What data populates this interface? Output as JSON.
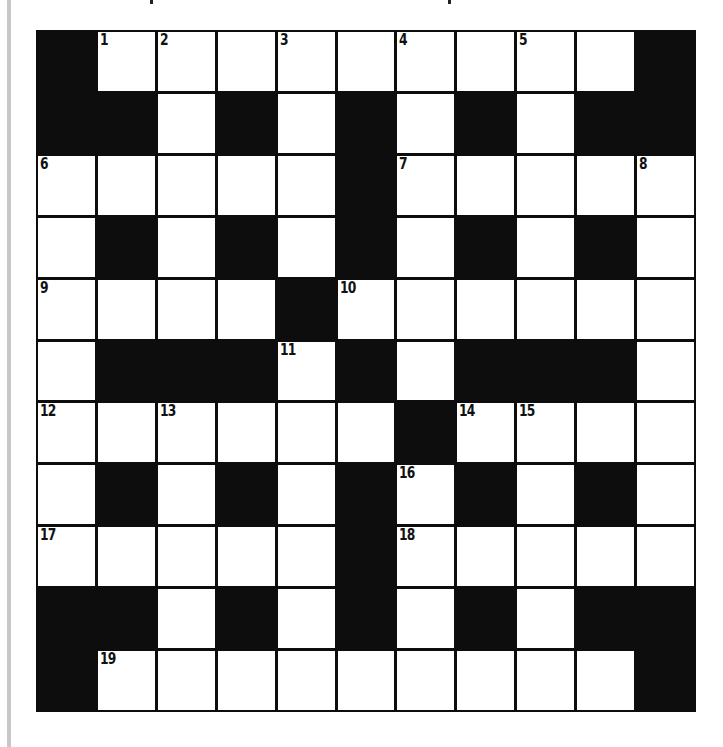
{
  "puzzle": {
    "rows": 11,
    "cols": 11,
    "colors": {
      "block": "#0d0d0d",
      "cell": "#ffffff",
      "grid_line": "#0d0d0d",
      "left_rule": "#c8c8c8"
    },
    "layout": [
      "#.........#",
      "##.#.#.#.##",
      ".....#.....",
      ".#.#.#.#.#.",
      "....#......",
      ".###.#.###.",
      "......#....",
      ".#.#.#.#.#.",
      ".....#.....",
      "##.#.#.#.##",
      "#.........#"
    ],
    "numbers": [
      {
        "row": 0,
        "col": 1,
        "label": "1"
      },
      {
        "row": 0,
        "col": 2,
        "label": "2"
      },
      {
        "row": 0,
        "col": 4,
        "label": "3"
      },
      {
        "row": 0,
        "col": 6,
        "label": "4"
      },
      {
        "row": 0,
        "col": 8,
        "label": "5"
      },
      {
        "row": 2,
        "col": 0,
        "label": "6"
      },
      {
        "row": 2,
        "col": 6,
        "label": "7"
      },
      {
        "row": 2,
        "col": 10,
        "label": "8"
      },
      {
        "row": 4,
        "col": 0,
        "label": "9"
      },
      {
        "row": 4,
        "col": 5,
        "label": "10"
      },
      {
        "row": 5,
        "col": 4,
        "label": "11"
      },
      {
        "row": 6,
        "col": 0,
        "label": "12"
      },
      {
        "row": 6,
        "col": 2,
        "label": "13"
      },
      {
        "row": 6,
        "col": 7,
        "label": "14"
      },
      {
        "row": 6,
        "col": 8,
        "label": "15"
      },
      {
        "row": 7,
        "col": 6,
        "label": "16"
      },
      {
        "row": 8,
        "col": 0,
        "label": "17"
      },
      {
        "row": 8,
        "col": 6,
        "label": "18"
      },
      {
        "row": 10,
        "col": 1,
        "label": "19"
      }
    ],
    "entries": {
      "across": [
        "1",
        "6",
        "7",
        "9",
        "10",
        "12",
        "14",
        "17",
        "18",
        "19"
      ],
      "down": [
        "2",
        "3",
        "4",
        "5",
        "6",
        "8",
        "11",
        "13",
        "15",
        "16"
      ]
    }
  }
}
